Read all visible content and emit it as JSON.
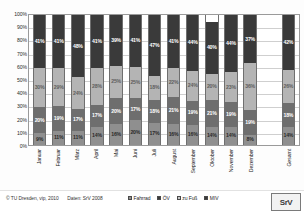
{
  "credit": {
    "copyright": "© TU Dresden, vip, 2010",
    "source": "Daten: SrV 2008"
  },
  "logo": {
    "text": "SrV"
  },
  "chart_data": {
    "type": "bar",
    "stacked": true,
    "normalized": "100%",
    "title": "",
    "subtitle": "",
    "xlabel": "",
    "ylabel": "",
    "ylim": [
      0,
      100
    ],
    "grid": true,
    "legend_position": "bottom",
    "categories": [
      "Januar",
      "Februar",
      "März",
      "April",
      "Mai",
      "Juni",
      "Juli",
      "August",
      "September",
      "Oktober",
      "November",
      "Dezember",
      "",
      "Gesamt"
    ],
    "tick_labels": [
      "100%",
      "90%",
      "80%",
      "70%",
      "60%",
      "50%",
      "40%",
      "30%",
      "20%",
      "10%",
      "0%"
    ],
    "tick_values": [
      100,
      90,
      80,
      70,
      60,
      50,
      40,
      30,
      20,
      10,
      0
    ],
    "series": [
      {
        "name": "Fahrrad",
        "color": "#8f8f8f",
        "values": [
          9,
          11,
          11,
          14,
          16,
          20,
          17,
          16,
          16,
          14,
          14,
          8,
          null,
          14
        ],
        "labels": [
          "9%",
          "11%",
          "11%",
          "14%",
          "16%",
          "20%",
          "17%",
          "16%",
          "16%",
          "14%",
          "14%",
          "8%",
          "",
          "14%"
        ]
      },
      {
        "name": "ÖV",
        "color": "#6e6e6e",
        "values": [
          20,
          19,
          17,
          17,
          20,
          17,
          18,
          21,
          19,
          21,
          19,
          19,
          null,
          18
        ],
        "labels": [
          "20%",
          "19%",
          "17%",
          "17%",
          "20%",
          "17%",
          "18%",
          "21%",
          "19%",
          "21%",
          "19%",
          "19%",
          "",
          "18%"
        ]
      },
      {
        "name": "zu Fuß",
        "color": "#b4b4b4",
        "values": [
          30,
          29,
          24,
          28,
          25,
          25,
          18,
          22,
          24,
          20,
          23,
          36,
          null,
          26
        ],
        "labels": [
          "30%",
          "29%",
          "24%",
          "28%",
          "25%",
          "25%",
          "18%",
          "22%",
          "24%",
          "20%",
          "23%",
          "36%",
          "",
          "26%"
        ]
      },
      {
        "name": "MIV",
        "color": "#3a3a3a",
        "values": [
          41,
          41,
          48,
          41,
          39,
          41,
          47,
          41,
          44,
          40,
          44,
          37,
          null,
          42
        ],
        "labels": [
          "41%",
          "41%",
          "48%",
          "41%",
          "39%",
          "41%",
          "47%",
          "41%",
          "44%",
          "40%",
          "44%",
          "37%",
          "",
          "42%"
        ]
      }
    ],
    "legend_entries": [
      {
        "label": "Fahrrad",
        "color": "#8f8f8f"
      },
      {
        "label": "ÖV",
        "color": "#3a3a3a"
      },
      {
        "label": "zu Fuß",
        "color": "#c8c8c8"
      },
      {
        "label": "MIV",
        "color": "#3a3a3a"
      }
    ]
  }
}
